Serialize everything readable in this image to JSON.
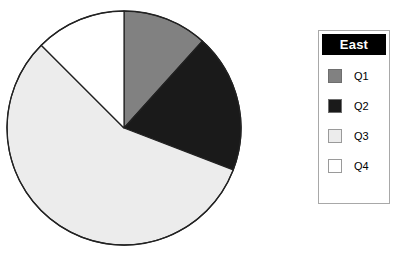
{
  "chart_data": {
    "type": "pie",
    "title": "",
    "series_name": "East",
    "categories": [
      "Q1",
      "Q2",
      "Q3",
      "Q4"
    ],
    "values": [
      11.7,
      19.2,
      56.6,
      12.5
    ],
    "value_unit": "percent",
    "start_angle_deg": 0,
    "direction": "clockwise",
    "slice_boundaries_deg": [
      0,
      42,
      111,
      315,
      360
    ],
    "slice_colors": [
      "#818181",
      "#1a1a1a",
      "#ececec",
      "#ffffff"
    ],
    "slice_outline_color": "#222222",
    "legend": {
      "position": "right",
      "title": "East",
      "title_text_color": "#ffffff",
      "title_bar_color": "#000000",
      "border_color": "#a8a8a8",
      "entries": [
        {
          "label": "Q1",
          "color": "#818181",
          "swatch_border": "#6e6e6e"
        },
        {
          "label": "Q2",
          "color": "#1a1a1a",
          "swatch_border": "#6e6e6e"
        },
        {
          "label": "Q3",
          "color": "#ececec",
          "swatch_border": "#9a9a9a"
        },
        {
          "label": "Q4",
          "color": "#ffffff",
          "swatch_border": "#9a9a9a"
        }
      ]
    },
    "geometry": {
      "center_x": 124,
      "center_y": 128,
      "radius": 117
    },
    "grid": false,
    "xlabel": "",
    "ylabel": ""
  }
}
